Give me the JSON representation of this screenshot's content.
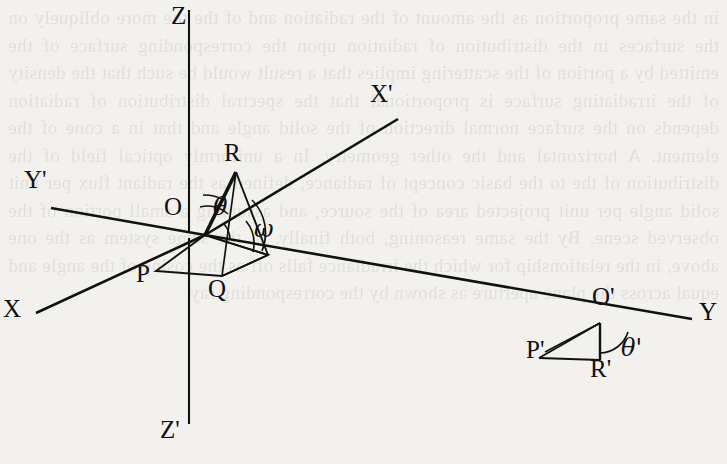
{
  "figure": {
    "kind": "geometry-diagram",
    "background_color": "#f3f1ee",
    "ink_color": "#111111",
    "axes": [
      {
        "name": "Z",
        "label": "Z",
        "x": 171,
        "y": 5,
        "desc": "vertical axis upward"
      },
      {
        "name": "Zp",
        "label": "Z'",
        "x": 163,
        "y": 419,
        "desc": "vertical axis downward"
      },
      {
        "name": "Xp",
        "label": "X'",
        "x": 372,
        "y": 82,
        "desc": "primed x axis upper right"
      },
      {
        "name": "Yp",
        "label": "Y'",
        "x": 26,
        "y": 166,
        "desc": "primed y axis upper left"
      },
      {
        "name": "X",
        "label": "X",
        "x": 4,
        "y": 296,
        "desc": "x axis lower left"
      },
      {
        "name": "Y",
        "label": "Y",
        "x": 700,
        "y": 299,
        "desc": "y axis lower right"
      }
    ],
    "points": [
      {
        "name": "O",
        "label": "O",
        "x": 165,
        "y": 196,
        "px": 205,
        "py": 235
      },
      {
        "name": "R",
        "label": "R",
        "x": 226,
        "y": 142,
        "px": 236,
        "py": 172
      },
      {
        "name": "P",
        "label": "P",
        "x": 137,
        "y": 262,
        "px": 156,
        "py": 271
      },
      {
        "name": "Q",
        "label": "Q",
        "x": 209,
        "y": 277,
        "px": 222,
        "py": 276
      },
      {
        "name": "Op",
        "label": "O'",
        "x": 594,
        "y": 285,
        "px": 600,
        "py": 323
      },
      {
        "name": "Pp",
        "label": "P'",
        "x": 528,
        "y": 338,
        "px": 539,
        "py": 358
      },
      {
        "name": "Rp",
        "label": "R'",
        "x": 592,
        "y": 356,
        "px": 600,
        "py": 360
      }
    ],
    "angles": [
      {
        "name": "theta",
        "label": "θ",
        "x": 214,
        "y": 196,
        "vertex": "O",
        "desc": "angle between OR and OZ"
      },
      {
        "name": "omega",
        "label": "ω",
        "x": 256,
        "y": 216,
        "vertex": "Q",
        "desc": "angle at base right vertex"
      },
      {
        "name": "theta-prime",
        "label": "θ'",
        "x": 623,
        "y": 337,
        "vertex": "O'",
        "desc": "angle at O' between O'R' and axis Y"
      }
    ],
    "bleed_through_text": "not legible reversed text showing through from the other side of the page"
  }
}
